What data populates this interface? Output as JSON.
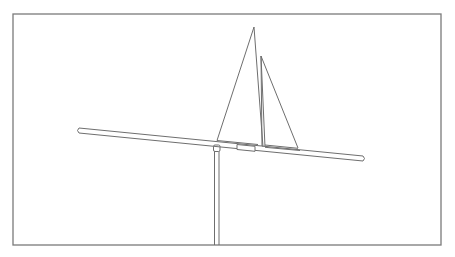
{
  "figure": {
    "stroke_color": "#6e6e6e",
    "frame_color": "#7a7a7a",
    "background": "#ffffff",
    "components": [
      "frame",
      "horizontal-rod",
      "mainsail",
      "jib-sail",
      "mast",
      "collar",
      "pivot-cap",
      "support-pole"
    ]
  },
  "caption": {
    "text": "",
    "note": "caption line clipped at bottom edge; illegible"
  }
}
